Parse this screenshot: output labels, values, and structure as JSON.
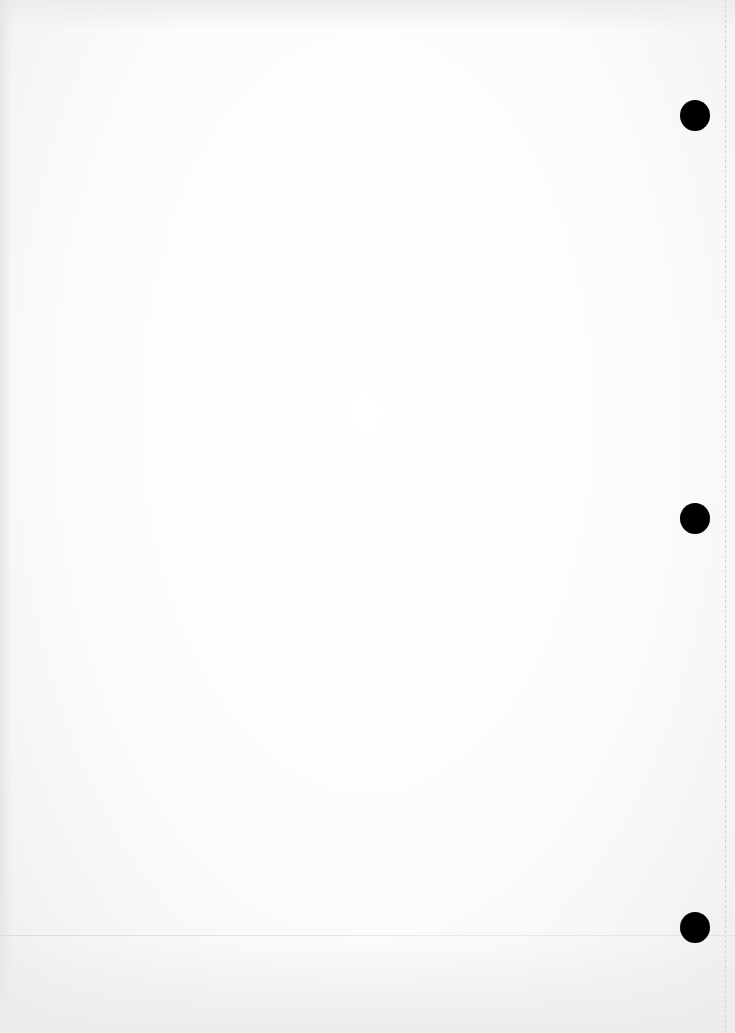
{
  "document": {
    "type": "blank scanned page",
    "text_content": "",
    "background_color": "#fafafa",
    "punch_holes": [
      {
        "cx": 695,
        "cy": 115,
        "color": "#000000"
      },
      {
        "cx": 695,
        "cy": 518,
        "color": "#000000"
      },
      {
        "cx": 695,
        "cy": 927,
        "color": "#000000"
      }
    ]
  }
}
